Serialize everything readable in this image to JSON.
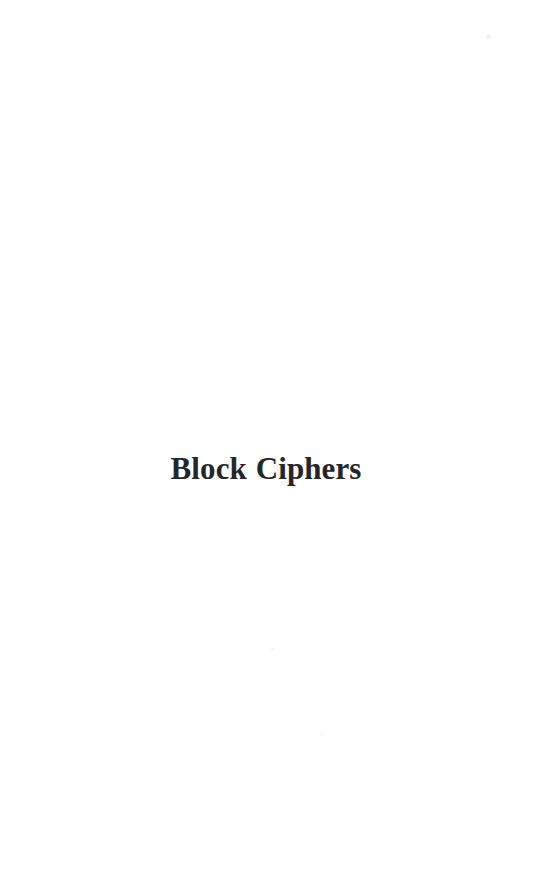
{
  "page": {
    "background_color": "#ffffff",
    "width": 542,
    "height": 884,
    "kind": "book-part-divider-page"
  },
  "content": {
    "part_title": "Block Ciphers",
    "title_color": "#26262a"
  },
  "artifacts": {
    "speck_top_right": "",
    "speck_middle": "",
    "speck_lower_right": ""
  }
}
